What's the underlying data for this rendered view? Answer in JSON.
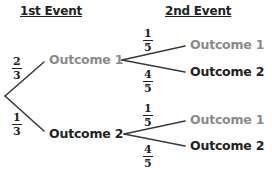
{
  "headers": {
    "first_event": "1st Event",
    "second_event": "2nd Event"
  },
  "first_level": {
    "branches": [
      {
        "outcome": "Outcome 1",
        "probability": {
          "numerator": "2",
          "denominator": "3"
        },
        "color": "#8a8a8a"
      },
      {
        "outcome": "Outcome 2",
        "probability": {
          "numerator": "1",
          "denominator": "3"
        },
        "color": "#222222"
      }
    ]
  },
  "second_level": {
    "from_outcome_1": [
      {
        "outcome": "Outcome 1",
        "probability": {
          "numerator": "1",
          "denominator": "5"
        },
        "color": "#8a8a8a"
      },
      {
        "outcome": "Outcome 2",
        "probability": {
          "numerator": "4",
          "denominator": "5"
        },
        "color": "#222222"
      }
    ],
    "from_outcome_2": [
      {
        "outcome": "Outcome 1",
        "probability": {
          "numerator": "1",
          "denominator": "5"
        },
        "color": "#8a8a8a"
      },
      {
        "outcome": "Outcome 2",
        "probability": {
          "numerator": "4",
          "denominator": "5"
        },
        "color": "#222222"
      }
    ]
  },
  "colors": {
    "line": "#3a3a3a",
    "gray_text": "#8a8a8a",
    "black_text": "#222222"
  }
}
